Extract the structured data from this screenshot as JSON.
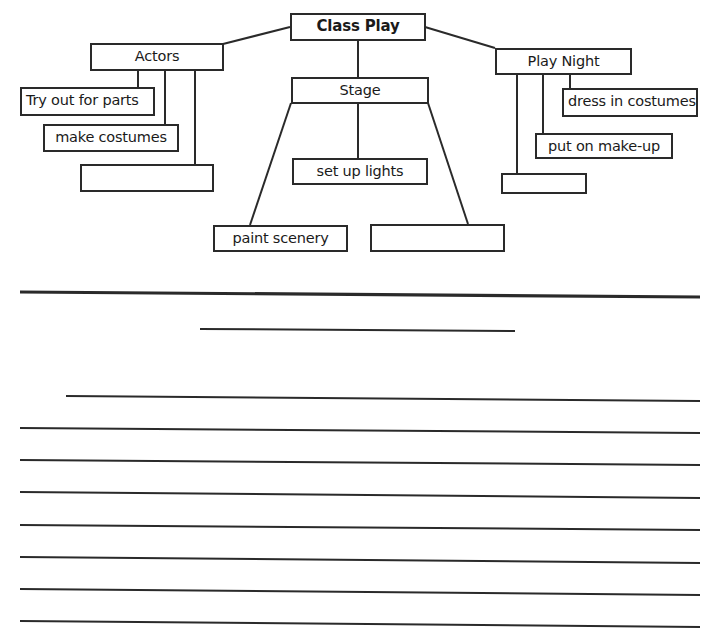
{
  "document": {
    "top_clipped_text": " ",
    "diagram": {
      "root": {
        "label": "Class Play"
      },
      "branches": [
        {
          "label": "Actors",
          "children": [
            "Try out for parts",
            "make costumes",
            ""
          ]
        },
        {
          "label": "Stage",
          "children": [
            "set up lights",
            "paint scenery",
            ""
          ]
        },
        {
          "label": "Play Night",
          "children": [
            "dress in costumes",
            "put on make-up",
            ""
          ]
        }
      ]
    },
    "writing_area": {
      "title_line_count": 1,
      "ruled_line_count": 8,
      "content": ""
    },
    "colors": {
      "ink": "#2a2a2a",
      "paper": "#ffffff"
    }
  }
}
